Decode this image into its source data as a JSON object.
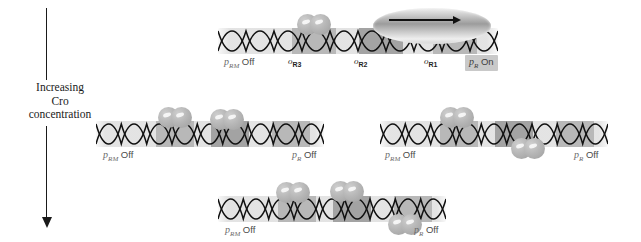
{
  "figure": {
    "width": 641,
    "height": 242,
    "background": "#ffffff"
  },
  "axis": {
    "name": "increasing-cro-concentration-axis",
    "caption_lines": [
      "Increasing",
      "Cro",
      "concentration"
    ],
    "direction": "downward",
    "color": "#1a1a1a"
  },
  "colors": {
    "dna_band": "#e2e2e2",
    "operator_band": "#b8b8b8",
    "operator_band_dark": "#a3a3a3",
    "cro_protein": "#b7b7b7",
    "polymerase": "#9c9c9c",
    "label_text": "#6b6b6b",
    "state_text": "#4a4a4a",
    "badge_background": "#c9c9c9",
    "helix_stroke": "#111111"
  },
  "operator_labels": [
    {
      "name": "operator-label-or3",
      "prefix": "o",
      "sub": "R3"
    },
    {
      "name": "operator-label-or2",
      "prefix": "o",
      "sub": "R2"
    },
    {
      "name": "operator-label-or1",
      "prefix": "o",
      "sub": "R1"
    }
  ],
  "promoter_labels": {
    "prm": {
      "prefix": "p",
      "sub": "RM"
    },
    "pr": {
      "prefix": "p",
      "sub": "R"
    },
    "state_off": "Off",
    "state_on": "On"
  },
  "rows": [
    {
      "name": "row-1-low-cro",
      "strands": [
        {
          "name": "strand-top-center",
          "cro_count": 1,
          "polymerase": true,
          "prm_state": "Off",
          "pr_state": "On",
          "pr_badge": true,
          "show_operator_labels": true
        }
      ]
    },
    {
      "name": "row-2-medium-cro",
      "strands": [
        {
          "name": "strand-mid-left",
          "cro_count": 2,
          "polymerase": false,
          "prm_state": "Off",
          "pr_state": "Off",
          "pr_badge": false,
          "show_operator_labels": false
        },
        {
          "name": "strand-mid-right",
          "cro_count": 2,
          "polymerase": false,
          "prm_state": "Off",
          "pr_state": "Off",
          "pr_badge": false,
          "show_operator_labels": false
        }
      ]
    },
    {
      "name": "row-3-high-cro",
      "strands": [
        {
          "name": "strand-bottom-center",
          "cro_count": 3,
          "polymerase": false,
          "prm_state": "Off",
          "pr_state": "Off",
          "pr_badge": false,
          "show_operator_labels": false
        }
      ]
    }
  ],
  "strand_states": {
    "top_prm": "Off",
    "top_pr": "On",
    "mid_left_prm": "Off",
    "mid_left_pr": "Off",
    "mid_right_prm": "Off",
    "mid_right_pr": "Off",
    "bottom_prm": "Off",
    "bottom_pr": "Off"
  }
}
